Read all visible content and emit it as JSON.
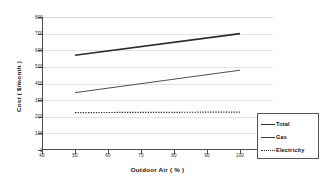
{
  "chart_data": {
    "type": "line",
    "title": "",
    "xlabel": "Outdoor Air ( % )",
    "ylabel": "Cost ( $/month )",
    "xlim": [
      40,
      110
    ],
    "ylim": [
      0,
      800
    ],
    "xticks": [
      "40",
      "50",
      "60",
      "70",
      "80",
      "90",
      "100",
      "110"
    ],
    "yticks": [
      "0",
      "100",
      "200",
      "300",
      "400",
      "500",
      "600",
      "700",
      "800"
    ],
    "grid": "horizontal",
    "legend_position": "lower-right",
    "x": [
      50,
      100
    ],
    "series": [
      {
        "name": "Total",
        "values": [
          570,
          700
        ],
        "style": "solid-thick",
        "color": "#2b2b2b"
      },
      {
        "name": "Gas",
        "values": [
          345,
          480
        ],
        "style": "solid-thin",
        "color": "#3a3a3a"
      },
      {
        "name": "Electricity",
        "values": [
          225,
          228
        ],
        "style": "dotted",
        "color": "#2b2b2b"
      }
    ]
  },
  "axes": {
    "x_title": "Outdoor Air ( % )",
    "y_title": "Cost ( $/month )",
    "x_tick_labels": [
      "40",
      "50",
      "60",
      "70",
      "80",
      "90",
      "100",
      "110"
    ],
    "y_tick_labels": [
      "0",
      "100",
      "200",
      "300",
      "400",
      "500",
      "600",
      "700",
      "800"
    ]
  },
  "legend": {
    "items": [
      {
        "label": "Total"
      },
      {
        "label": "Gas"
      },
      {
        "label": "Electricity"
      }
    ]
  }
}
